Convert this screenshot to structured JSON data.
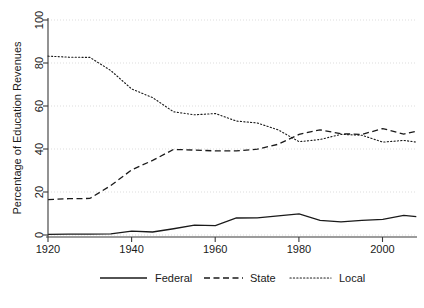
{
  "chart_data": {
    "type": "line",
    "title": "",
    "subtitle": "",
    "xlabel": "",
    "ylabel": "Percentage of Education Revenues",
    "xlim": [
      1920,
      2008
    ],
    "ylim": [
      0,
      100
    ],
    "xticks": [
      1920,
      1940,
      1960,
      1980,
      2000
    ],
    "yticks": [
      0,
      20,
      40,
      60,
      80,
      100
    ],
    "grid": "horizontal-dotted",
    "legend_position": "bottom",
    "x": [
      1920,
      1925,
      1930,
      1935,
      1940,
      1945,
      1950,
      1955,
      1960,
      1965,
      1970,
      1975,
      1980,
      1985,
      1990,
      1995,
      2000,
      2005,
      2008
    ],
    "series": [
      {
        "name": "Federal",
        "style": "solid",
        "color": "#1a1a1a",
        "values": [
          0.3,
          0.4,
          0.4,
          0.5,
          1.8,
          1.4,
          2.9,
          4.6,
          4.4,
          7.9,
          8.0,
          8.9,
          9.8,
          6.8,
          6.1,
          6.8,
          7.3,
          9.1,
          8.5
        ]
      },
      {
        "name": "State",
        "style": "dashed",
        "color": "#1a1a1a",
        "values": [
          16.5,
          16.9,
          17.0,
          23.0,
          30.3,
          34.7,
          39.8,
          39.5,
          39.1,
          39.1,
          39.9,
          42.2,
          46.8,
          48.9,
          47.1,
          46.8,
          49.5,
          46.9,
          48.3
        ]
      },
      {
        "name": "Local",
        "style": "dotted",
        "color": "#1a1a1a",
        "values": [
          83.2,
          82.7,
          82.6,
          76.5,
          67.9,
          63.9,
          57.3,
          55.9,
          56.5,
          53.0,
          52.1,
          48.9,
          43.4,
          44.4,
          46.8,
          46.4,
          43.2,
          44.0,
          43.2
        ]
      }
    ]
  },
  "axis": {
    "y_title": "Percentage of Education Revenues",
    "y_tick_labels": [
      "0",
      "20",
      "40",
      "60",
      "80",
      "100"
    ],
    "x_tick_labels": [
      "1920",
      "1940",
      "1960",
      "1980",
      "2000"
    ]
  },
  "legend": {
    "entries": [
      {
        "label": "Federal",
        "style": "solid"
      },
      {
        "label": "State",
        "style": "dashed"
      },
      {
        "label": "Local",
        "style": "dotted"
      }
    ]
  }
}
